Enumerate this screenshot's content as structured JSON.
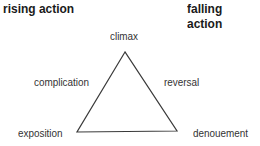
{
  "headers": {
    "left": "rising action",
    "right": "falling action"
  },
  "nodes": {
    "top": "climax",
    "upper_left": "complication",
    "upper_right": "reversal",
    "bottom_left": "exposition",
    "bottom_right": "denouement"
  },
  "colors": {
    "line": "#3a3a3a",
    "text": "#333333"
  }
}
